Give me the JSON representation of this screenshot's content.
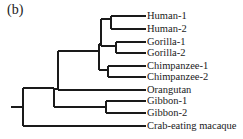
{
  "figure": {
    "panel_label": "(b)",
    "type": "phylogenetic-tree",
    "line_color": "#1a1a1a"
  },
  "taxa": [
    {
      "label": "Human-1",
      "y": 16
    },
    {
      "label": "Human-2",
      "y": 29
    },
    {
      "label": "Gorilla-1",
      "y": 42
    },
    {
      "label": "Gorilla-2",
      "y": 53
    },
    {
      "label": "Chimpanzee-1",
      "y": 66
    },
    {
      "label": "Chimpanzee-2",
      "y": 77
    },
    {
      "label": "Orangutan",
      "y": 90
    },
    {
      "label": "Gibbon-1",
      "y": 101
    },
    {
      "label": "Gibbon-2",
      "y": 113
    },
    {
      "label": "Crab-eating macaque",
      "y": 126
    }
  ],
  "tree_newick": "(((((Human-1,Human-2),(Gorilla-1,Gorilla-2)),(Chimpanzee-1,Chimpanzee-2)),Orangutan),(Gibbon-1,Gibbon-2)),Crab-eating macaque);"
}
